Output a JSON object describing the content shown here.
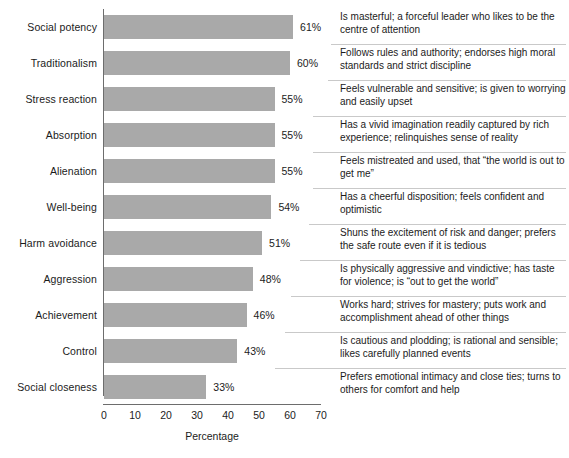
{
  "chart_data": {
    "type": "bar",
    "orientation": "horizontal",
    "title": "",
    "xlabel": "Percentage",
    "ylabel": "",
    "xlim": [
      0,
      70
    ],
    "xticks": [
      0,
      10,
      20,
      30,
      40,
      50,
      60,
      70
    ],
    "grid": false,
    "legend": null,
    "bar_color": "#a9a9a9",
    "axis_color": "#6d6d6d",
    "value_suffix": "%",
    "categories": [
      "Social potency",
      "Traditionalism",
      "Stress reaction",
      "Absorption",
      "Alienation",
      "Well-being",
      "Harm avoidance",
      "Aggression",
      "Achievement",
      "Control",
      "Social closeness"
    ],
    "values": [
      61,
      60,
      55,
      55,
      55,
      54,
      51,
      48,
      46,
      43,
      33
    ],
    "value_labels": [
      "61%",
      "60%",
      "55%",
      "55%",
      "55%",
      "54%",
      "51%",
      "48%",
      "46%",
      "43%",
      "33%"
    ],
    "annotations": [
      "Is masterful; a forceful leader who likes to be the centre of attention",
      "Follows rules and authority; endorses high moral standards and strict discipline",
      "Feels vulnerable and sensitive; is given to worrying and easily upset",
      "Has a vivid imagination readily captured by rich experience; relinquishes sense of reality",
      "Feels mistreated and used, that “the world is out to get me”",
      "Has a cheerful disposition; feels confident and optimistic",
      "Shuns the excitement of risk and danger; prefers the safe route even if it is tedious",
      "Is physically aggressive and vindictive; has taste for violence; is “out to get the world”",
      "Works hard; strives for mastery; puts work and accomplishment ahead of other things",
      "Is cautious and plodding; is rational and sensible; likes carefully planned events",
      "Prefers emotional intimacy and close ties; turns to others for comfort and help"
    ]
  }
}
